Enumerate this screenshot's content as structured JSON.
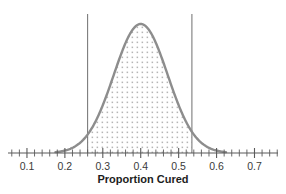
{
  "chart_data": {
    "type": "area",
    "title": "",
    "subtitle": "",
    "xlabel": "Proportion Cured",
    "ylabel": "",
    "xlim": [
      0.05,
      0.762
    ],
    "ylim": [
      0,
      1.05
    ],
    "grid": false,
    "legend": null,
    "curve": {
      "name": "Sampling distribution of proportion cured",
      "shape": "normal",
      "mean": 0.4,
      "sd": 0.071,
      "peak_x": 0.4,
      "peak_y": 1.0,
      "color": "#8d8d8d",
      "line_width": 2.4,
      "x": [
        0.18,
        0.2,
        0.22,
        0.24,
        0.26,
        0.28,
        0.3,
        0.32,
        0.34,
        0.36,
        0.38,
        0.4,
        0.42,
        0.44,
        0.46,
        0.48,
        0.5,
        0.52,
        0.54,
        0.56,
        0.58,
        0.6,
        0.62
      ],
      "y": [
        0.007,
        0.016,
        0.033,
        0.064,
        0.114,
        0.189,
        0.291,
        0.416,
        0.552,
        0.683,
        0.786,
        0.847,
        0.847,
        0.786,
        0.683,
        0.552,
        0.416,
        0.291,
        0.189,
        0.114,
        0.064,
        0.033,
        0.016
      ]
    },
    "shaded_region": {
      "name": "confidence-interval-shading",
      "fill_style": "stipple-dots",
      "dot_color": "#b5b5b5",
      "x_start": 0.26,
      "x_end": 0.535
    },
    "reference_lines": [
      {
        "name": "lower-bound",
        "x": 0.26,
        "color": "#6f6f6f",
        "width": 1
      },
      {
        "name": "upper-bound",
        "x": 0.535,
        "color": "#6f6f6f",
        "width": 1
      }
    ],
    "axis": {
      "color": "#5a5a5a",
      "major_tick_values": [
        0.1,
        0.2,
        0.3,
        0.4,
        0.5,
        0.6,
        0.7
      ],
      "major_tick_labels": [
        "0.1",
        "0.2",
        "0.3",
        "0.4",
        "0.5",
        "0.6",
        "0.7"
      ],
      "minor_tick_step": 0.02,
      "minor_tick_start": 0.06,
      "minor_tick_end": 0.76
    }
  }
}
